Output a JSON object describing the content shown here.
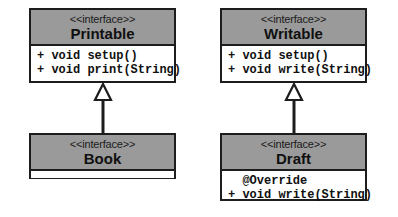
{
  "diagram": {
    "type": "uml-class-diagram",
    "background": "#ffffff",
    "header_fill": "#9a9a9a",
    "line_color": "#1d1d1d",
    "stereotype": "<<interface>>",
    "boxes": [
      {
        "id": "printable",
        "stereotype": "<<interface>>",
        "name": "Printable",
        "members": [
          "+ void setup()",
          "+ void print(String)"
        ]
      },
      {
        "id": "writable",
        "stereotype": "<<interface>>",
        "name": "Writable",
        "members": [
          "+ void setup()",
          "+ void write(String)"
        ]
      },
      {
        "id": "book",
        "stereotype": "<<interface>>",
        "name": "Book",
        "members": []
      },
      {
        "id": "draft",
        "stereotype": "<<interface>>",
        "name": "Draft",
        "members": [
          "  @Override",
          "+ void write(String)"
        ]
      }
    ],
    "relationships": [
      {
        "id": "book-implements-printable",
        "kind": "generalization",
        "from": "book",
        "to": "printable",
        "arrowhead": "hollow-triangle"
      },
      {
        "id": "draft-implements-writable",
        "kind": "generalization",
        "from": "draft",
        "to": "writable",
        "arrowhead": "hollow-triangle"
      }
    ]
  }
}
